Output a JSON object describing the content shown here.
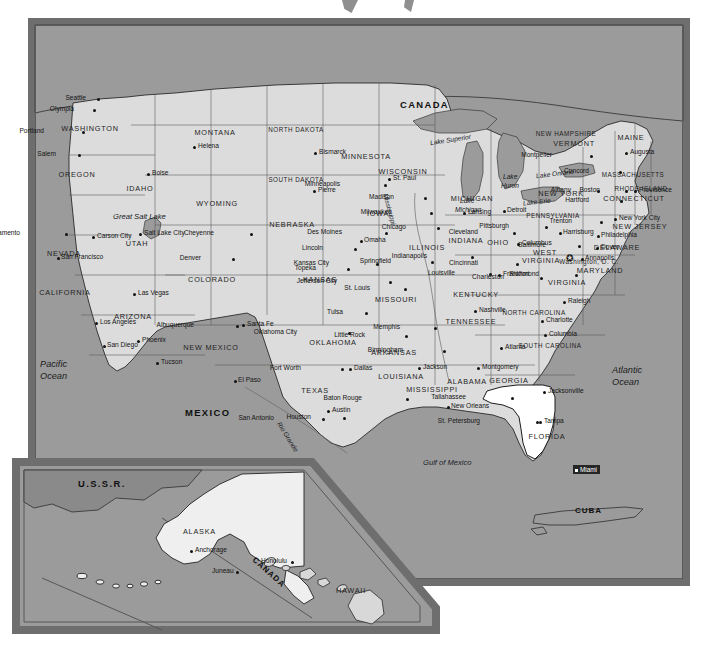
{
  "document": {
    "type": "map",
    "title": "United States of America",
    "projection_note": "contiguous U.S. with Alaska and Hawaii inset"
  },
  "colors": {
    "ocean": "#9b9b9b",
    "land": "#dcdcdc",
    "highlight_state": "#ffffff",
    "frame": "#6e6e6e",
    "selection": "#262626",
    "text": "#1b1b1b"
  },
  "countries": [
    {
      "name": "CANADA",
      "x": 400,
      "y": 100
    },
    {
      "name": "MEXICO",
      "x": 185,
      "y": 408
    },
    {
      "name": "CUBA",
      "x": 575,
      "y": 507
    }
  ],
  "oceans": [
    {
      "name": "Pacific",
      "name2": "Ocean",
      "x": 40,
      "y": 360
    },
    {
      "name": "Atlantic",
      "name2": "Ocean",
      "x": 612,
      "y": 366
    },
    {
      "name": "Gulf of Mexico",
      "x": 423,
      "y": 459
    }
  ],
  "lakes": [
    {
      "name": "Lake Superior",
      "x": 430,
      "y": 137
    },
    {
      "name": "Lake",
      "name2": "Michigan",
      "x": 460,
      "y": 198
    },
    {
      "name": "Lake",
      "name2": "Huron",
      "x": 503,
      "y": 174
    },
    {
      "name": "Lake Erie",
      "x": 523,
      "y": 199
    },
    {
      "name": "Lake Ontario",
      "x": 536,
      "y": 171
    },
    {
      "name": "Great Salt Lake",
      "x": 121,
      "y": 216
    }
  ],
  "rivers": [
    {
      "name": "Mississippi",
      "x": 384,
      "y": 196
    },
    {
      "name": "Rio Grande",
      "x": 279,
      "y": 424
    }
  ],
  "selection": {
    "label": "Miami",
    "x": 565,
    "y": 451
  },
  "capital_marker": {
    "name": "washington-dc-star",
    "x": 566,
    "y": 258
  },
  "states": [
    {
      "abbr": "WA",
      "name": "WASHINGTON",
      "x": 90,
      "y": 129
    },
    {
      "abbr": "OR",
      "name": "OREGON",
      "x": 77,
      "y": 175
    },
    {
      "abbr": "ID",
      "name": "IDAHO",
      "x": 140,
      "y": 189
    },
    {
      "abbr": "MT",
      "name": "MONTANA",
      "x": 215,
      "y": 133
    },
    {
      "abbr": "ND",
      "name": "NORTH DAKOTA",
      "x": 296,
      "y": 130
    },
    {
      "abbr": "SD",
      "name": "SOUTH DAKOTA",
      "x": 296,
      "y": 180
    },
    {
      "abbr": "MN",
      "name": "MINNESOTA",
      "x": 366,
      "y": 157
    },
    {
      "abbr": "WI",
      "name": "WISCONSIN",
      "x": 403,
      "y": 172
    },
    {
      "abbr": "MI",
      "name": "MICHIGAN",
      "x": 472,
      "y": 199
    },
    {
      "abbr": "WY",
      "name": "WYOMING",
      "x": 217,
      "y": 204
    },
    {
      "abbr": "NV",
      "name": "NEVADA",
      "x": 64,
      "y": 254
    },
    {
      "abbr": "UT",
      "name": "UTAH",
      "x": 137,
      "y": 244
    },
    {
      "abbr": "CO",
      "name": "COLORADO",
      "x": 212,
      "y": 280
    },
    {
      "abbr": "NE",
      "name": "NEBRASKA",
      "x": 292,
      "y": 225
    },
    {
      "abbr": "IA",
      "name": "IOWA",
      "x": 378,
      "y": 214
    },
    {
      "abbr": "IL",
      "name": "ILLINOIS",
      "x": 427,
      "y": 248
    },
    {
      "abbr": "IN",
      "name": "INDIANA",
      "x": 466,
      "y": 241
    },
    {
      "abbr": "OH",
      "name": "OHIO",
      "x": 498,
      "y": 243
    },
    {
      "abbr": "CA",
      "name": "CALIFORNIA",
      "x": 65,
      "y": 293
    },
    {
      "abbr": "AZ",
      "name": "ARIZONA",
      "x": 133,
      "y": 317
    },
    {
      "abbr": "NM",
      "name": "NEW MEXICO",
      "x": 211,
      "y": 348
    },
    {
      "abbr": "KS",
      "name": "KANSAS",
      "x": 320,
      "y": 280
    },
    {
      "abbr": "MO",
      "name": "MISSOURI",
      "x": 396,
      "y": 300
    },
    {
      "abbr": "KY",
      "name": "KENTUCKY",
      "x": 476,
      "y": 295
    },
    {
      "abbr": "WV",
      "name": "WEST",
      "x": 545,
      "y": 253
    },
    {
      "abbr": "WV2",
      "name": "VIRGINIA",
      "x": 541,
      "y": 261
    },
    {
      "abbr": "VA",
      "name": "VIRGINIA",
      "x": 567,
      "y": 283
    },
    {
      "abbr": "OK",
      "name": "OKLAHOMA",
      "x": 333,
      "y": 343
    },
    {
      "abbr": "AR",
      "name": "ARKANSAS",
      "x": 394,
      "y": 353
    },
    {
      "abbr": "TN",
      "name": "TENNESSEE",
      "x": 471,
      "y": 322
    },
    {
      "abbr": "NC",
      "name": "NORTH CAROLINA",
      "x": 534,
      "y": 313
    },
    {
      "abbr": "SC",
      "name": "SOUTH CAROLINA",
      "x": 550,
      "y": 346
    },
    {
      "abbr": "TX",
      "name": "TEXAS",
      "x": 315,
      "y": 391
    },
    {
      "abbr": "LA",
      "name": "LOUISIANA",
      "x": 401,
      "y": 377
    },
    {
      "abbr": "MS",
      "name": "MISSISSIPPI",
      "x": 432,
      "y": 390
    },
    {
      "abbr": "AL",
      "name": "ALABAMA",
      "x": 467,
      "y": 382
    },
    {
      "abbr": "GA",
      "name": "GEORGIA",
      "x": 509,
      "y": 381
    },
    {
      "abbr": "FL",
      "name": "FLORIDA",
      "x": 547,
      "y": 437
    },
    {
      "abbr": "PA",
      "name": "PENNSYLVANIA",
      "x": 553,
      "y": 216
    },
    {
      "abbr": "NY",
      "name": "NEW YORK",
      "x": 561,
      "y": 194
    },
    {
      "abbr": "NH",
      "name": "NEW HAMPSHIRE",
      "x": 566,
      "y": 134
    },
    {
      "abbr": "VT",
      "name": "VERMONT",
      "x": 574,
      "y": 144
    },
    {
      "abbr": "ME",
      "name": "MAINE",
      "x": 631,
      "y": 138
    },
    {
      "abbr": "MA",
      "name": "MASSACHUSETTS",
      "x": 633,
      "y": 175
    },
    {
      "abbr": "RI",
      "name": "RHODE ISLAND",
      "x": 641,
      "y": 189
    },
    {
      "abbr": "CT",
      "name": "CONNECTICUT",
      "x": 634,
      "y": 199
    },
    {
      "abbr": "NJ",
      "name": "NEW JERSEY",
      "x": 640,
      "y": 227
    },
    {
      "abbr": "DE",
      "name": "DELAWARE",
      "x": 617,
      "y": 248
    },
    {
      "abbr": "MD",
      "name": "MARYLAND",
      "x": 600,
      "y": 271
    },
    {
      "abbr": "DC",
      "name": "Washington, D. C.",
      "x": 589,
      "y": 262
    }
  ],
  "cities": [
    {
      "name": "Seattle",
      "x": 97,
      "y": 98,
      "dx": -11,
      "dy": -3,
      "anchor": "left"
    },
    {
      "name": "Olympia",
      "x": 93,
      "y": 109,
      "dx": -19,
      "dy": -3,
      "anchor": "left"
    },
    {
      "name": "Portland",
      "x": 82,
      "y": 131,
      "dx": -38,
      "dy": -3,
      "anchor": "left"
    },
    {
      "name": "Salem",
      "x": 78,
      "y": 154,
      "dx": -22,
      "dy": -3,
      "anchor": "left"
    },
    {
      "name": "Boise",
      "x": 147,
      "y": 173,
      "dx": 5,
      "dy": -3,
      "anchor": "left"
    },
    {
      "name": "Helena",
      "x": 193,
      "y": 146,
      "dx": 5,
      "dy": -3,
      "anchor": "left"
    },
    {
      "name": "Bismarck",
      "x": 314,
      "y": 152,
      "dx": 5,
      "dy": -3,
      "anchor": "left"
    },
    {
      "name": "Pierre",
      "x": 313,
      "y": 190,
      "dx": 5,
      "dy": -3,
      "anchor": "left"
    },
    {
      "name": "St. Paul",
      "x": 388,
      "y": 178,
      "dx": 5,
      "dy": -3,
      "anchor": "left"
    },
    {
      "name": "Minneapolis",
      "x": 384,
      "y": 184,
      "dx": -44,
      "dy": -3,
      "anchor": "left"
    },
    {
      "name": "Madison",
      "x": 424,
      "y": 197,
      "dx": -30,
      "dy": -3,
      "anchor": "left"
    },
    {
      "name": "Milwaukee",
      "x": 430,
      "y": 212,
      "dx": -38,
      "dy": -3,
      "anchor": "left"
    },
    {
      "name": "Lansing",
      "x": 463,
      "y": 212,
      "dx": 5,
      "dy": -3,
      "anchor": "left"
    },
    {
      "name": "Chicago",
      "x": 437,
      "y": 227,
      "dx": -31,
      "dy": -3,
      "anchor": "left"
    },
    {
      "name": "Cheyenne",
      "x": 250,
      "y": 233,
      "dx": -36,
      "dy": -3,
      "anchor": "left"
    },
    {
      "name": "Des Moines",
      "x": 385,
      "y": 232,
      "dx": -43,
      "dy": -3,
      "anchor": "left"
    },
    {
      "name": "Omaha",
      "x": 360,
      "y": 240,
      "dx": 4,
      "dy": -3,
      "anchor": "left"
    },
    {
      "name": "Lincoln",
      "x": 354,
      "y": 248,
      "dx": -31,
      "dy": -3,
      "anchor": "left"
    },
    {
      "name": "Salt Lake City",
      "x": 139,
      "y": 233,
      "dx": 5,
      "dy": -3,
      "anchor": "left"
    },
    {
      "name": "Sacramento",
      "x": 65,
      "y": 233,
      "dx": -45,
      "dy": -3,
      "anchor": "left"
    },
    {
      "name": "Carson City",
      "x": 92,
      "y": 236,
      "dx": 5,
      "dy": -3,
      "anchor": "left"
    },
    {
      "name": "San Francisco",
      "x": 57,
      "y": 257,
      "dx": 4,
      "dy": -3,
      "anchor": "left"
    },
    {
      "name": "Denver",
      "x": 232,
      "y": 258,
      "dx": -31,
      "dy": -3,
      "anchor": "left"
    },
    {
      "name": "Topeka",
      "x": 347,
      "y": 268,
      "dx": -31,
      "dy": -3,
      "anchor": "left"
    },
    {
      "name": "Kansas City",
      "x": 376,
      "y": 263,
      "dx": -47,
      "dy": -3,
      "anchor": "left"
    },
    {
      "name": "Jefferson City",
      "x": 389,
      "y": 281,
      "dx": -52,
      "dy": -3,
      "anchor": "left"
    },
    {
      "name": "St. Louis",
      "x": 404,
      "y": 288,
      "dx": -34,
      "dy": -3,
      "anchor": "left"
    },
    {
      "name": "Springfield",
      "x": 431,
      "y": 261,
      "dx": -40,
      "dy": -3,
      "anchor": "left"
    },
    {
      "name": "Indianapolis",
      "x": 471,
      "y": 256,
      "dx": -44,
      "dy": -3,
      "anchor": "left"
    },
    {
      "name": "Cleveland",
      "x": 513,
      "y": 232,
      "dx": -35,
      "dy": -3,
      "anchor": "left"
    },
    {
      "name": "Columbus",
      "x": 517,
      "y": 243,
      "dx": 5,
      "dy": -3,
      "anchor": "left"
    },
    {
      "name": "Cincinnati",
      "x": 516,
      "y": 263,
      "dx": -38,
      "dy": -3,
      "anchor": "left"
    },
    {
      "name": "Frankfort",
      "x": 498,
      "y": 274,
      "dx": 5,
      "dy": -3,
      "anchor": "left"
    },
    {
      "name": "Louisville",
      "x": 489,
      "y": 273,
      "dx": -34,
      "dy": -3,
      "anchor": "left"
    },
    {
      "name": "Charleston",
      "x": 540,
      "y": 277,
      "dx": -36,
      "dy": -3,
      "anchor": "left"
    },
    {
      "name": "Richmond",
      "x": 575,
      "y": 274,
      "dx": -36,
      "dy": -3,
      "anchor": "left"
    },
    {
      "name": "Detroit",
      "x": 503,
      "y": 210,
      "dx": 4,
      "dy": -3,
      "anchor": "left"
    },
    {
      "name": "Pittsburgh",
      "x": 545,
      "y": 226,
      "dx": -36,
      "dy": -3,
      "anchor": "left"
    },
    {
      "name": "Harrisburg",
      "x": 559,
      "y": 232,
      "dx": 4,
      "dy": -3,
      "anchor": "left"
    },
    {
      "name": "Albany",
      "x": 597,
      "y": 190,
      "dx": -26,
      "dy": -3,
      "anchor": "left"
    },
    {
      "name": "Montpelier",
      "x": 590,
      "y": 155,
      "dx": -38,
      "dy": -3,
      "anchor": "left"
    },
    {
      "name": "Concord",
      "x": 619,
      "y": 171,
      "dx": -30,
      "dy": -3,
      "anchor": "left"
    },
    {
      "name": "Augusta",
      "x": 625,
      "y": 152,
      "dx": 5,
      "dy": -3,
      "anchor": "left"
    },
    {
      "name": "Boston",
      "x": 625,
      "y": 190,
      "dx": -25,
      "dy": -3,
      "anchor": "left"
    },
    {
      "name": "Providence",
      "x": 634,
      "y": 190,
      "dx": 5,
      "dy": -3,
      "anchor": "left"
    },
    {
      "name": "Hartford",
      "x": 620,
      "y": 200,
      "dx": -31,
      "dy": -3,
      "anchor": "left"
    },
    {
      "name": "New York City",
      "x": 614,
      "y": 218,
      "dx": 5,
      "dy": -3,
      "anchor": "left"
    },
    {
      "name": "Trenton",
      "x": 600,
      "y": 221,
      "dx": -28,
      "dy": -3,
      "anchor": "left"
    },
    {
      "name": "Philadelphia",
      "x": 597,
      "y": 235,
      "dx": 4,
      "dy": -3,
      "anchor": "left"
    },
    {
      "name": "Dover",
      "x": 596,
      "y": 247,
      "dx": 5,
      "dy": -3,
      "anchor": "left"
    },
    {
      "name": "Baltimore",
      "x": 578,
      "y": 245,
      "dx": -32,
      "dy": -3,
      "anchor": "left"
    },
    {
      "name": "Annapolis",
      "x": 581,
      "y": 258,
      "dx": 4,
      "dy": -3,
      "anchor": "left"
    },
    {
      "name": "Las Vegas",
      "x": 133,
      "y": 293,
      "dx": 5,
      "dy": -3,
      "anchor": "left"
    },
    {
      "name": "Los Angeles",
      "x": 95,
      "y": 322,
      "dx": 5,
      "dy": -3,
      "anchor": "left"
    },
    {
      "name": "San Diego",
      "x": 103,
      "y": 345,
      "dx": 4,
      "dy": -3,
      "anchor": "left"
    },
    {
      "name": "Phoenix",
      "x": 137,
      "y": 340,
      "dx": 5,
      "dy": -3,
      "anchor": "left"
    },
    {
      "name": "Tucson",
      "x": 156,
      "y": 362,
      "dx": 5,
      "dy": -3,
      "anchor": "left"
    },
    {
      "name": "Albuquerque",
      "x": 236,
      "y": 325,
      "dx": -42,
      "dy": -3,
      "anchor": "left"
    },
    {
      "name": "Santa Fe",
      "x": 242,
      "y": 324,
      "dx": 5,
      "dy": -3,
      "anchor": "left"
    },
    {
      "name": "El Paso",
      "x": 234,
      "y": 380,
      "dx": 4,
      "dy": -3,
      "anchor": "left"
    },
    {
      "name": "Oklahoma City",
      "x": 348,
      "y": 332,
      "dx": -51,
      "dy": -3,
      "anchor": "left"
    },
    {
      "name": "Tulsa",
      "x": 365,
      "y": 312,
      "dx": -22,
      "dy": -3,
      "anchor": "left"
    },
    {
      "name": "Little Rock",
      "x": 405,
      "y": 335,
      "dx": -40,
      "dy": -3,
      "anchor": "left"
    },
    {
      "name": "Memphis",
      "x": 434,
      "y": 327,
      "dx": -34,
      "dy": -3,
      "anchor": "left"
    },
    {
      "name": "Nashville",
      "x": 474,
      "y": 310,
      "dx": 5,
      "dy": -3,
      "anchor": "left"
    },
    {
      "name": "Fort Worth",
      "x": 341,
      "y": 368,
      "dx": -40,
      "dy": -3,
      "anchor": "left"
    },
    {
      "name": "Dallas",
      "x": 349,
      "y": 368,
      "dx": 5,
      "dy": -3,
      "anchor": "left"
    },
    {
      "name": "Jackson",
      "x": 418,
      "y": 367,
      "dx": 5,
      "dy": -3,
      "anchor": "left"
    },
    {
      "name": "Birmingham",
      "x": 443,
      "y": 350,
      "dx": -40,
      "dy": -3,
      "anchor": "left"
    },
    {
      "name": "Montgomery",
      "x": 477,
      "y": 367,
      "dx": 5,
      "dy": -3,
      "anchor": "left"
    },
    {
      "name": "Atlanta",
      "x": 500,
      "y": 347,
      "dx": 5,
      "dy": -3,
      "anchor": "left"
    },
    {
      "name": "Columbia",
      "x": 544,
      "y": 334,
      "dx": 5,
      "dy": -3,
      "anchor": "left"
    },
    {
      "name": "Charlotte",
      "x": 541,
      "y": 320,
      "dx": 5,
      "dy": -3,
      "anchor": "left"
    },
    {
      "name": "Raleigh",
      "x": 563,
      "y": 301,
      "dx": 5,
      "dy": -3,
      "anchor": "left"
    },
    {
      "name": "Austin",
      "x": 327,
      "y": 410,
      "dx": 5,
      "dy": -3,
      "anchor": "left"
    },
    {
      "name": "San Antonio",
      "x": 322,
      "y": 418,
      "dx": -48,
      "dy": -3,
      "anchor": "left"
    },
    {
      "name": "Houston",
      "x": 343,
      "y": 417,
      "dx": -32,
      "dy": -3,
      "anchor": "left"
    },
    {
      "name": "Baton Rouge",
      "x": 406,
      "y": 398,
      "dx": -44,
      "dy": -3,
      "anchor": "left"
    },
    {
      "name": "New Orleans",
      "x": 447,
      "y": 406,
      "dx": 4,
      "dy": -3,
      "anchor": "left"
    },
    {
      "name": "Tallahassee",
      "x": 511,
      "y": 397,
      "dx": -45,
      "dy": -3,
      "anchor": "left"
    },
    {
      "name": "Jacksonville",
      "x": 543,
      "y": 391,
      "dx": 5,
      "dy": -3,
      "anchor": "left"
    },
    {
      "name": "Tampa",
      "x": 539,
      "y": 421,
      "dx": 5,
      "dy": -3,
      "anchor": "left"
    },
    {
      "name": "St. Petersburg",
      "x": 536,
      "y": 421,
      "dx": -56,
      "dy": -3,
      "anchor": "left"
    }
  ],
  "inset": {
    "labels": [
      {
        "name": "U.S.S.R.",
        "kind": "country",
        "x": 78,
        "y": 479
      },
      {
        "name": "ALASKA",
        "kind": "state",
        "x": 183,
        "y": 528
      },
      {
        "name": "CANADA",
        "kind": "country",
        "x": 256,
        "y": 556,
        "rotate": true
      },
      {
        "name": "HAWAII",
        "kind": "state",
        "x": 336,
        "y": 587
      }
    ],
    "cities": [
      {
        "name": "Anchorage",
        "x": 190,
        "y": 550,
        "dx": 4,
        "dy": -3
      },
      {
        "name": "Juneau",
        "x": 236,
        "y": 571,
        "dx": -24,
        "dy": -3
      },
      {
        "name": "Honolulu",
        "x": 291,
        "y": 561,
        "dx": -30,
        "dy": -3
      }
    ]
  }
}
